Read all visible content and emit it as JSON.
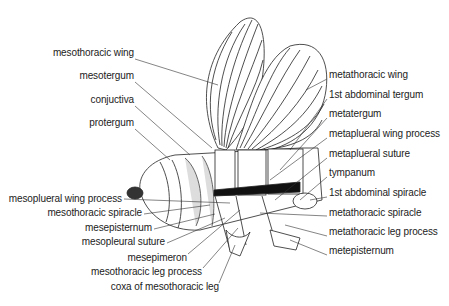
{
  "diagram": {
    "left_labels": [
      {
        "text": "mesothoracic wing",
        "x": 134,
        "y": 53
      },
      {
        "text": "mesotergum",
        "x": 134,
        "y": 76
      },
      {
        "text": "conjuctiva",
        "x": 134,
        "y": 100
      },
      {
        "text": "protergum",
        "x": 134,
        "y": 123
      },
      {
        "text": "mesoplueral wing process",
        "x": 122,
        "y": 199
      },
      {
        "text": "mesothoracic spiracle",
        "x": 142,
        "y": 213
      },
      {
        "text": "mesepisternum",
        "x": 152,
        "y": 228
      },
      {
        "text": "mesopleural suture",
        "x": 165,
        "y": 242
      },
      {
        "text": "mesepimeron",
        "x": 187,
        "y": 258
      },
      {
        "text": "mesothoracic leg process",
        "x": 202,
        "y": 272
      },
      {
        "text": "coxa of mesothoracic leg",
        "x": 219,
        "y": 287
      }
    ],
    "right_labels": [
      {
        "text": "metathoracic wing",
        "x": 329,
        "y": 75
      },
      {
        "text": "1st abdominal tergum",
        "x": 329,
        "y": 95
      },
      {
        "text": "metatergum",
        "x": 329,
        "y": 114
      },
      {
        "text": "metaplueral wing process",
        "x": 329,
        "y": 134
      },
      {
        "text": "metaplueral suture",
        "x": 329,
        "y": 154
      },
      {
        "text": "tympanum",
        "x": 329,
        "y": 173
      },
      {
        "text": "1st abdominal spiracle",
        "x": 329,
        "y": 193
      },
      {
        "text": "metathoracic spiracle",
        "x": 329,
        "y": 213
      },
      {
        "text": "metathoracic leg process",
        "x": 329,
        "y": 232
      },
      {
        "text": "metepisternum",
        "x": 329,
        "y": 251
      }
    ]
  }
}
